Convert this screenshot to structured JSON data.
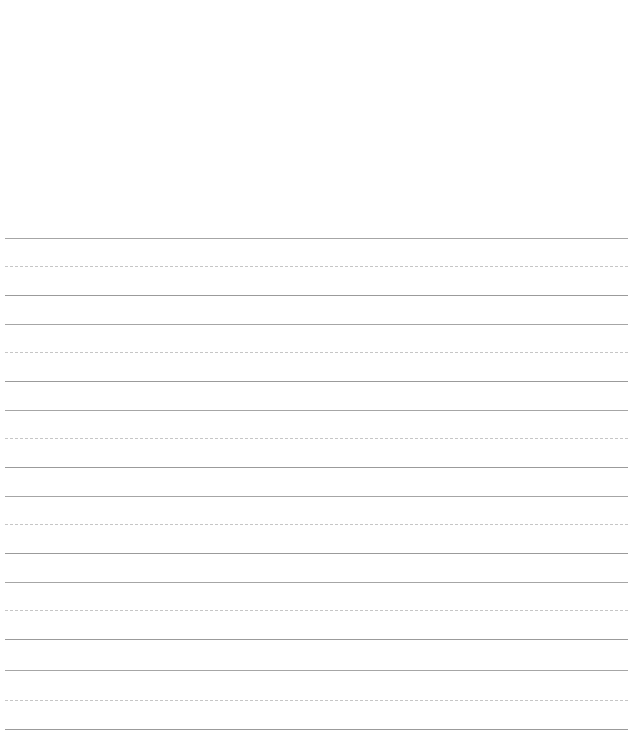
{
  "page": {
    "width": 641,
    "height": 740,
    "background_color": "#ffffff",
    "paper_type": "penmanship-ruled",
    "blank_top_margin_px": 230,
    "content_text": ""
  },
  "colors": {
    "background": "#ffffff",
    "solid_rule": "#a6a6a6",
    "baseline_rule": "#9b9b9b",
    "dashed_rule": "#c6c6c6"
  },
  "ruling": {
    "left_x": 5,
    "right_x": 628,
    "line_width_px": 623,
    "stroke_width_px": 1,
    "dash_length_px": 5,
    "dash_gap_px": 4,
    "group_pattern": "solid-dashed-solid",
    "groups_count": 6,
    "lines_count": 18,
    "lines": [
      {
        "index": 0,
        "y": 238,
        "style": "solid",
        "role": "topline",
        "group": 1
      },
      {
        "index": 1,
        "y": 266,
        "style": "dashed",
        "role": "midline",
        "group": 1
      },
      {
        "index": 2,
        "y": 295,
        "style": "solid",
        "role": "baseline",
        "group": 1
      },
      {
        "index": 3,
        "y": 324,
        "style": "solid",
        "role": "topline",
        "group": 2
      },
      {
        "index": 4,
        "y": 352,
        "style": "dashed",
        "role": "midline",
        "group": 2
      },
      {
        "index": 5,
        "y": 381,
        "style": "solid",
        "role": "baseline",
        "group": 2
      },
      {
        "index": 6,
        "y": 410,
        "style": "solid",
        "role": "topline",
        "group": 3
      },
      {
        "index": 7,
        "y": 438,
        "style": "dashed",
        "role": "midline",
        "group": 3
      },
      {
        "index": 8,
        "y": 467,
        "style": "solid",
        "role": "baseline",
        "group": 3
      },
      {
        "index": 9,
        "y": 496,
        "style": "solid",
        "role": "topline",
        "group": 4
      },
      {
        "index": 10,
        "y": 524,
        "style": "dashed",
        "role": "midline",
        "group": 4
      },
      {
        "index": 11,
        "y": 553,
        "style": "solid",
        "role": "baseline",
        "group": 4
      },
      {
        "index": 12,
        "y": 582,
        "style": "solid",
        "role": "topline",
        "group": 5
      },
      {
        "index": 13,
        "y": 610,
        "style": "dashed",
        "role": "midline",
        "group": 5
      },
      {
        "index": 14,
        "y": 639,
        "style": "solid",
        "role": "baseline",
        "group": 5
      },
      {
        "index": 15,
        "y": 670,
        "style": "solid",
        "role": "topline",
        "group": 6
      },
      {
        "index": 16,
        "y": 700,
        "style": "dashed",
        "role": "midline",
        "group": 6
      },
      {
        "index": 17,
        "y": 729,
        "style": "solid",
        "role": "baseline",
        "group": 6
      }
    ]
  }
}
